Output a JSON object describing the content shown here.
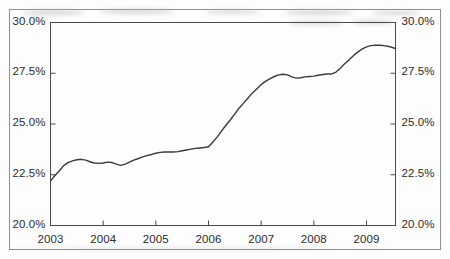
{
  "chart_data": {
    "type": "line",
    "title": "",
    "subtitle": "",
    "xlabel": "",
    "ylabel": "",
    "ylabel_right": "",
    "ylim": [
      20.0,
      30.0
    ],
    "xlim": [
      2003.0,
      2009.55
    ],
    "grid": false,
    "legend": false,
    "legend_position": "none",
    "y_tick_values": [
      30.0,
      27.5,
      25.0,
      22.5,
      20.0
    ],
    "y_tick_labels_left": [
      "30.0%",
      "27.5%",
      "25.0%",
      "22.5%",
      "20.0%"
    ],
    "y_tick_labels_right": [
      "30.0%",
      "27.5%",
      "25.0%",
      "22.5%",
      "20.0%"
    ],
    "x_tick_values": [
      2003,
      2004,
      2005,
      2006,
      2007,
      2008,
      2009
    ],
    "x_tick_labels": [
      "2003",
      "2004",
      "2005",
      "2006",
      "2007",
      "2008",
      "2009"
    ],
    "series": [
      {
        "name": "series-1",
        "color": "#3a3a3a",
        "x": [
          2003.0,
          2003.08,
          2003.17,
          2003.25,
          2003.33,
          2003.42,
          2003.5,
          2003.58,
          2003.67,
          2003.75,
          2003.83,
          2003.92,
          2004.0,
          2004.08,
          2004.17,
          2004.25,
          2004.33,
          2004.42,
          2004.5,
          2004.58,
          2004.67,
          2004.75,
          2004.83,
          2004.92,
          2005.0,
          2005.08,
          2005.17,
          2005.25,
          2005.33,
          2005.42,
          2005.5,
          2005.58,
          2005.67,
          2005.75,
          2005.83,
          2005.92,
          2006.0,
          2006.08,
          2006.17,
          2006.25,
          2006.33,
          2006.42,
          2006.5,
          2006.58,
          2006.67,
          2006.75,
          2006.83,
          2006.92,
          2007.0,
          2007.08,
          2007.17,
          2007.25,
          2007.33,
          2007.42,
          2007.5,
          2007.58,
          2007.67,
          2007.75,
          2007.83,
          2007.92,
          2008.0,
          2008.08,
          2008.17,
          2008.25,
          2008.33,
          2008.42,
          2008.5,
          2008.58,
          2008.67,
          2008.75,
          2008.83,
          2008.92,
          2009.0,
          2009.08,
          2009.17,
          2009.25,
          2009.33,
          2009.42,
          2009.55
        ],
        "y": [
          22.2,
          22.45,
          22.7,
          22.95,
          23.1,
          23.18,
          23.24,
          23.26,
          23.22,
          23.14,
          23.08,
          23.06,
          23.08,
          23.12,
          23.1,
          23.02,
          22.96,
          23.02,
          23.12,
          23.22,
          23.3,
          23.38,
          23.44,
          23.5,
          23.56,
          23.6,
          23.62,
          23.62,
          23.62,
          23.64,
          23.68,
          23.72,
          23.76,
          23.8,
          23.82,
          23.84,
          23.88,
          24.1,
          24.38,
          24.66,
          24.94,
          25.22,
          25.5,
          25.78,
          26.04,
          26.28,
          26.52,
          26.74,
          26.94,
          27.1,
          27.24,
          27.34,
          27.42,
          27.45,
          27.42,
          27.32,
          27.26,
          27.28,
          27.32,
          27.34,
          27.36,
          27.4,
          27.44,
          27.46,
          27.46,
          27.56,
          27.74,
          27.96,
          28.16,
          28.36,
          28.54,
          28.7,
          28.8,
          28.86,
          28.88,
          28.88,
          28.86,
          28.82,
          28.72
        ]
      }
    ],
    "annotations": []
  },
  "figure": {
    "background_color": "#fdfdfd",
    "border_color": "#8e8e8e",
    "axis_color": "#4a4a4a",
    "text_color": "#2b2b2b"
  }
}
